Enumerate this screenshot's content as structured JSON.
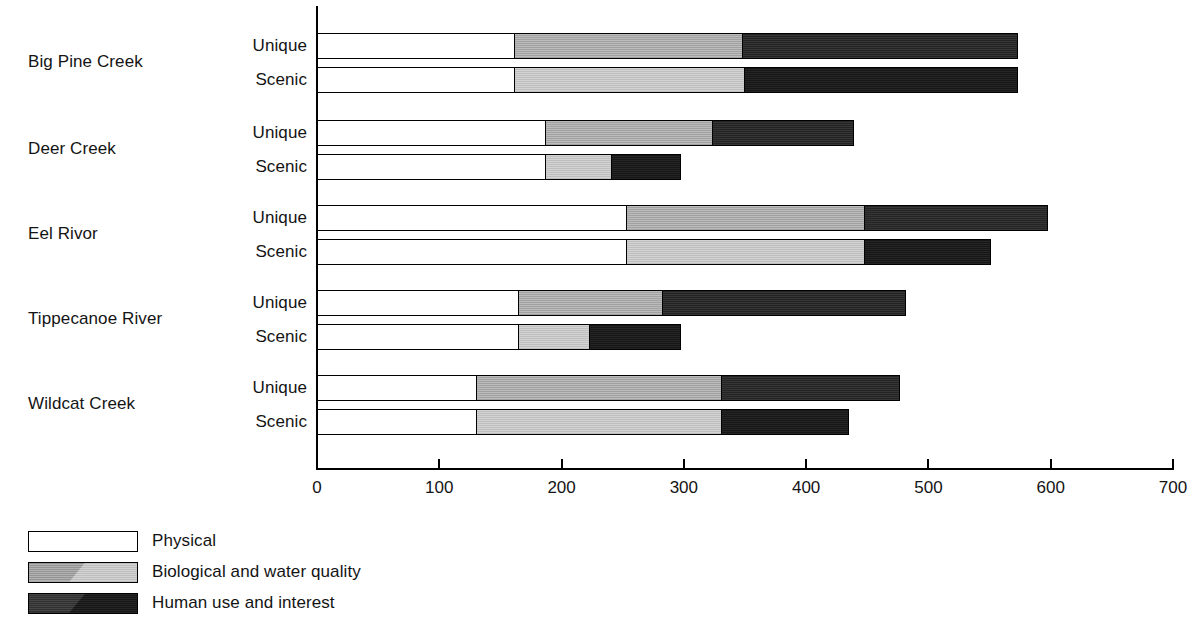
{
  "chart_data": {
    "type": "bar",
    "orientation": "horizontal",
    "stacked": true,
    "title": "",
    "xlabel": "",
    "ylabel": "",
    "xlim": [
      0,
      700
    ],
    "xticks": [
      0,
      100,
      200,
      300,
      400,
      500,
      600,
      700
    ],
    "xtick_labels": [
      "0",
      "100",
      "200",
      "300",
      "400",
      "500",
      "600",
      "700"
    ],
    "grid": false,
    "legend_position": "bottom-left",
    "legend": [
      {
        "name": "Physical",
        "key": "physical",
        "swatch": "white-outline"
      },
      {
        "name": "Biological and water quality",
        "key": "biological",
        "swatch": "gray-hatched"
      },
      {
        "name": "Human use and interest",
        "key": "human",
        "swatch": "black-hatched"
      }
    ],
    "series": [
      {
        "name": "Physical",
        "values": [
          162,
          162,
          188,
          188,
          254,
          254,
          166,
          166,
          131,
          131
        ]
      },
      {
        "name": "Biological and water quality",
        "values": [
          188,
          190,
          138,
          55,
          196,
          196,
          119,
          59,
          202,
          202
        ]
      },
      {
        "name": "Human use and interest",
        "values": [
          226,
          224,
          116,
          57,
          150,
          104,
          199,
          75,
          146,
          105
        ]
      }
    ],
    "groups": [
      {
        "label": "Big Pine Creek",
        "bars": [
          {
            "label": "Unique",
            "physical": 162,
            "biological": 188,
            "human": 226,
            "total": 576
          },
          {
            "label": "Scenic",
            "physical": 162,
            "biological": 190,
            "human": 224,
            "total": 576
          }
        ]
      },
      {
        "label": "Deer Creek",
        "bars": [
          {
            "label": "Unique",
            "physical": 188,
            "biological": 138,
            "human": 116,
            "total": 442
          },
          {
            "label": "Scenic",
            "physical": 188,
            "biological": 55,
            "human": 57,
            "total": 300
          }
        ]
      },
      {
        "label": "Eel Rivor",
        "bars": [
          {
            "label": "Unique",
            "physical": 254,
            "biological": 196,
            "human": 150,
            "total": 600
          },
          {
            "label": "Scenic",
            "physical": 254,
            "biological": 196,
            "human": 104,
            "total": 554
          }
        ]
      },
      {
        "label": "Tippecanoe River",
        "bars": [
          {
            "label": "Unique",
            "physical": 166,
            "biological": 119,
            "human": 199,
            "total": 484
          },
          {
            "label": "Scenic",
            "physical": 166,
            "biological": 59,
            "human": 75,
            "total": 300
          }
        ]
      },
      {
        "label": "Wildcat Creek",
        "bars": [
          {
            "label": "Unique",
            "physical": 131,
            "biological": 202,
            "human": 146,
            "total": 479
          },
          {
            "label": "Scenic",
            "physical": 131,
            "biological": 202,
            "human": 105,
            "total": 438
          }
        ]
      }
    ],
    "colors": {
      "physical": "#ffffff",
      "biological": "#c2c2c2",
      "human": "#242424",
      "axis": "#000000",
      "text": "#141414"
    }
  }
}
